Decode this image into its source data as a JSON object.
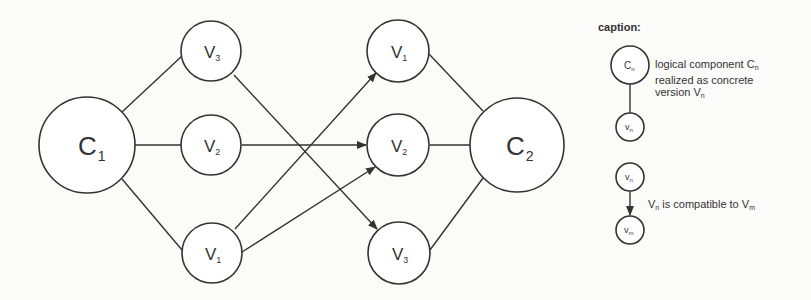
{
  "diagram": {
    "nodes": {
      "c1": {
        "label": "C",
        "sub": "1"
      },
      "c2": {
        "label": "C",
        "sub": "2"
      },
      "left": [
        {
          "label": "V",
          "sub": "3"
        },
        {
          "label": "V",
          "sub": "2"
        },
        {
          "label": "V",
          "sub": "1"
        }
      ],
      "right": [
        {
          "label": "V",
          "sub": "1"
        },
        {
          "label": "V",
          "sub": "2"
        },
        {
          "label": "V",
          "sub": "3"
        }
      ]
    },
    "edges": [
      {
        "from": "C1",
        "to": "left V3",
        "type": "line"
      },
      {
        "from": "C1",
        "to": "left V2",
        "type": "line"
      },
      {
        "from": "C1",
        "to": "left V1",
        "type": "line"
      },
      {
        "from": "left V3",
        "to": "right V3",
        "type": "arrow"
      },
      {
        "from": "left V2",
        "to": "right V2",
        "type": "arrow"
      },
      {
        "from": "left V1",
        "to": "right V1",
        "type": "arrow"
      },
      {
        "from": "left V1",
        "to": "right V2",
        "type": "arrow"
      },
      {
        "from": "right V1",
        "to": "C2",
        "type": "line"
      },
      {
        "from": "right V2",
        "to": "C2",
        "type": "line"
      },
      {
        "from": "right V3",
        "to": "C2",
        "type": "line"
      }
    ]
  },
  "caption": {
    "title": "caption:",
    "legend1": {
      "big_node": {
        "label": "C",
        "sub": "n"
      },
      "small_node": {
        "label": "v",
        "sub": "n"
      },
      "line1_pre": "logical component C",
      "line1_sub": "n",
      "line2": "realized as concrete",
      "line3_pre": "version V",
      "line3_sub": "n"
    },
    "legend2": {
      "top_node": {
        "label": "v",
        "sub": "n"
      },
      "bottom_node": {
        "label": "v",
        "sub": "m"
      },
      "text_pre": "V",
      "text_sub1": "n",
      "text_mid": " is compatible to V",
      "text_sub2": "m"
    }
  }
}
